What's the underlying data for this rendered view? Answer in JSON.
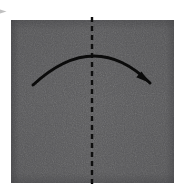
{
  "figure": {
    "type": "origami-instruction-diagram",
    "title": "Fold paper in half from left to right",
    "background_color": "#ffffff",
    "width": 182,
    "height": 196
  },
  "paper": {
    "name": "square-sheet",
    "shape": "square",
    "fill_color": "#5a5a5c",
    "edge_shadow_color": "#4a4a4d",
    "texture": "matte-paper-grain",
    "x": 11,
    "y": 20,
    "width": 163,
    "height": 163
  },
  "fold_line": {
    "name": "vertical-center-crease",
    "style": "dashed",
    "orientation": "vertical",
    "color": "#0e0e0e",
    "stroke_width": 2.4,
    "dash_length": 5,
    "gap_length": 4,
    "x": 92,
    "y_start": 17,
    "y_end": 186
  },
  "fold_arrow": {
    "name": "fold-direction-arrow",
    "direction": "left-to-right",
    "curve": "arc-over-top",
    "color": "#0b0b0b",
    "stroke_width": 3,
    "tail_x": 33,
    "tail_y": 85,
    "apex_x": 93,
    "apex_y": 56,
    "head_x": 150,
    "head_y": 83,
    "head_angle_deg": 42
  },
  "corner_mark": {
    "name": "cropped-arrow-fragment",
    "color": "#8c8c8c",
    "x": 0,
    "y": 9,
    "width": 7,
    "height": 5
  },
  "labels": {
    "step_text": "",
    "caption": ""
  }
}
